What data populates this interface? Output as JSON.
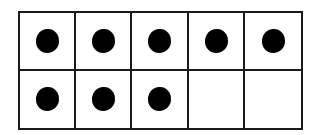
{
  "ten_frame": {
    "rows": 2,
    "columns": 5,
    "total_cells": 10,
    "filled_count": 8,
    "dot_color": "#000000",
    "line_color": "#1a1a1a",
    "cells": [
      {
        "row": 1,
        "col": 1,
        "filled": true
      },
      {
        "row": 1,
        "col": 2,
        "filled": true
      },
      {
        "row": 1,
        "col": 3,
        "filled": true
      },
      {
        "row": 1,
        "col": 4,
        "filled": true
      },
      {
        "row": 1,
        "col": 5,
        "filled": true
      },
      {
        "row": 2,
        "col": 1,
        "filled": true
      },
      {
        "row": 2,
        "col": 2,
        "filled": true
      },
      {
        "row": 2,
        "col": 3,
        "filled": true
      },
      {
        "row": 2,
        "col": 4,
        "filled": false
      },
      {
        "row": 2,
        "col": 5,
        "filled": false
      }
    ]
  }
}
